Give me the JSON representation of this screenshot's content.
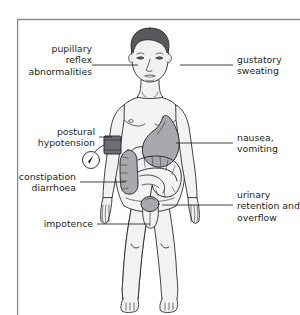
{
  "diagram": {
    "frame": {
      "border_color": "#8c8c8c"
    },
    "colors": {
      "outline": "#231f20",
      "skin_fill": "#f2f2f2",
      "hair_fill": "#58595b",
      "organ_fill": "#a7a9ac",
      "organ_dark": "#808285",
      "cuff_fill": "#6d6e71",
      "text": "#231f20",
      "leader_line": "#231f20"
    },
    "labels": [
      {
        "id": "pupillary-reflex-abnormalities",
        "lines": [
          "pupillary",
          "reflex",
          "abnormalities"
        ],
        "side": "left"
      },
      {
        "id": "gustatory-sweating",
        "lines": [
          "gustatory",
          "sweating"
        ],
        "side": "right"
      },
      {
        "id": "postural-hypotension",
        "lines": [
          "postural",
          "hypotension"
        ],
        "side": "left"
      },
      {
        "id": "nausea-vomiting",
        "lines": [
          "nausea,",
          "vomiting"
        ],
        "side": "right"
      },
      {
        "id": "constipation-diarrhoea",
        "lines": [
          "constipation",
          "diarrhoea"
        ],
        "side": "left"
      },
      {
        "id": "urinary-retention-overflow",
        "lines": [
          "urinary",
          "retention and",
          "overflow"
        ],
        "side": "right"
      },
      {
        "id": "impotence",
        "lines": [
          "impotence"
        ],
        "side": "left"
      }
    ],
    "anatomy": [
      {
        "name": "head"
      },
      {
        "name": "hair"
      },
      {
        "name": "eyes"
      },
      {
        "name": "nose"
      },
      {
        "name": "mouth"
      },
      {
        "name": "neck"
      },
      {
        "name": "torso"
      },
      {
        "name": "arms"
      },
      {
        "name": "hands"
      },
      {
        "name": "legs"
      },
      {
        "name": "feet"
      },
      {
        "name": "stomach"
      },
      {
        "name": "small-intestine"
      },
      {
        "name": "large-intestine"
      },
      {
        "name": "bladder"
      },
      {
        "name": "blood-pressure-cuff"
      },
      {
        "name": "pressure-gauge"
      }
    ]
  }
}
